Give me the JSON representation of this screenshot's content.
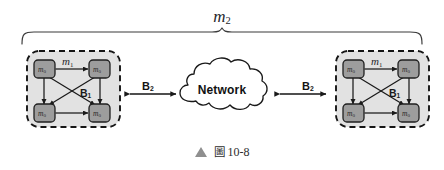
{
  "figure": {
    "domain": "diagram",
    "system_label": "m",
    "system_label_sub": "2",
    "caption": {
      "marker_icon": "triangle-up-icon",
      "cjk_word": "圖",
      "number": "10-8",
      "full_text": "圖 10-8"
    },
    "colors": {
      "background": "#ffffff",
      "stroke": "#1a1a1a",
      "cluster_fill": "#e2e2e2",
      "cluster_dash_stroke": "#151515",
      "node_fill": "#9d9d9d",
      "node_stroke": "#1f1f1f",
      "caption_marker": "#8f8f8f",
      "brace": "#3a3a3a"
    },
    "brace": {
      "name": "system-span-brace",
      "spans_label": "m2"
    },
    "network": {
      "label": "Network",
      "shape": "cloud"
    },
    "links": [
      {
        "id": "link-left",
        "label": "B",
        "label_sub": "2",
        "arrow": "double-headed",
        "from": "cluster-left",
        "to": "network"
      },
      {
        "id": "link-right",
        "label": "B",
        "label_sub": "2",
        "arrow": "double-headed",
        "from": "network",
        "to": "cluster-right"
      }
    ],
    "clusters": [
      {
        "id": "cluster-left",
        "bus_label": "B",
        "bus_label_sub": "1",
        "module_label": "m",
        "module_label_sub": "1",
        "border": "dashed",
        "nodes": [
          {
            "id": "left-node-tl",
            "label": "m",
            "label_sub": "0",
            "position": "top-left"
          },
          {
            "id": "left-node-tr",
            "label": "m",
            "label_sub": "0",
            "position": "top-right"
          },
          {
            "id": "left-node-bl",
            "label": "m",
            "label_sub": "0",
            "position": "bottom-left"
          },
          {
            "id": "left-node-br",
            "label": "m",
            "label_sub": "0",
            "position": "bottom-right"
          }
        ],
        "internal_edges": [
          "top-left<->top-right",
          "bottom-left<->bottom-right",
          "top-left<->bottom-left",
          "top-right<->bottom-right",
          "top-left<->bottom-right",
          "top-right<->bottom-left"
        ]
      },
      {
        "id": "cluster-right",
        "bus_label": "B",
        "bus_label_sub": "1",
        "module_label": "m",
        "module_label_sub": "1",
        "border": "dashed",
        "nodes": [
          {
            "id": "right-node-tl",
            "label": "m",
            "label_sub": "0",
            "position": "top-left"
          },
          {
            "id": "right-node-tr",
            "label": "m",
            "label_sub": "0",
            "position": "top-right"
          },
          {
            "id": "right-node-bl",
            "label": "m",
            "label_sub": "0",
            "position": "bottom-left"
          },
          {
            "id": "right-node-br",
            "label": "m",
            "label_sub": "0",
            "position": "bottom-right"
          }
        ],
        "internal_edges": [
          "top-left<->top-right",
          "bottom-left<->bottom-right",
          "top-left<->bottom-left",
          "top-right<->bottom-right",
          "top-left<->bottom-right",
          "top-right<->bottom-left"
        ]
      }
    ]
  }
}
